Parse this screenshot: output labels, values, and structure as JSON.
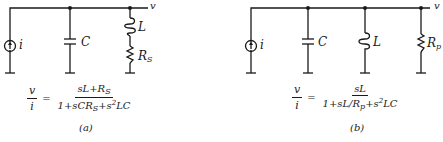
{
  "circuit_a": {
    "source_label": "i",
    "output_label": "v",
    "capacitor_label": "C",
    "inductor_label": "L",
    "resistor_label": "R",
    "resistor_sub": "S",
    "equation": {
      "lhs_num": "v",
      "lhs_den": "i",
      "equals": "=",
      "numerator": "sL+R",
      "numerator_sub": "S",
      "denominator_a": "1+sCR",
      "denominator_sub": "S",
      "denominator_b": "+s",
      "denominator_sup": "2",
      "denominator_c": "LC"
    },
    "caption": "(a)"
  },
  "circuit_b": {
    "source_label": "i",
    "output_label": "v",
    "capacitor_label": "C",
    "inductor_label": "L",
    "resistor_label": "R",
    "resistor_sub": "p",
    "equation": {
      "lhs_num": "v",
      "lhs_den": "i",
      "equals": "=",
      "numerator": "sL",
      "denominator_a": "1+sL/R",
      "denominator_sub": "p",
      "denominator_b": "+s",
      "denominator_sup": "2",
      "denominator_c": "LC"
    },
    "caption": "(b)"
  }
}
